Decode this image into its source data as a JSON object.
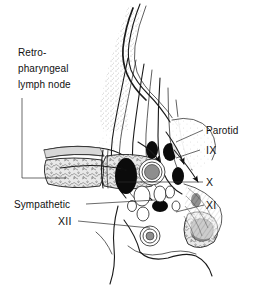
{
  "figure": {
    "background_color": "#ffffff",
    "ink_color": "#1a1a1a"
  },
  "labels": {
    "retropharyngeal": {
      "line1": "Retro-",
      "line2": "pharyngeal",
      "line3": "lymph node",
      "name": "retropharyngeal-lymph-node"
    },
    "parotid": {
      "text": "Parotid",
      "name": "parotid-gland"
    },
    "nerve_ix": {
      "text": "IX",
      "name": "glossopharyngeal-nerve"
    },
    "nerve_x": {
      "text": "X",
      "name": "vagus-nerve"
    },
    "nerve_xi": {
      "text": "XI",
      "name": "accessory-nerve"
    },
    "nerve_xii": {
      "text": "XII",
      "name": "hypoglossal-nerve"
    },
    "sympathetic": {
      "text": "Sympathetic",
      "name": "sympathetic-chain"
    }
  },
  "icons": {
    "arrowhead": "solid-triangle-arrowhead",
    "leader": "leader-line"
  }
}
